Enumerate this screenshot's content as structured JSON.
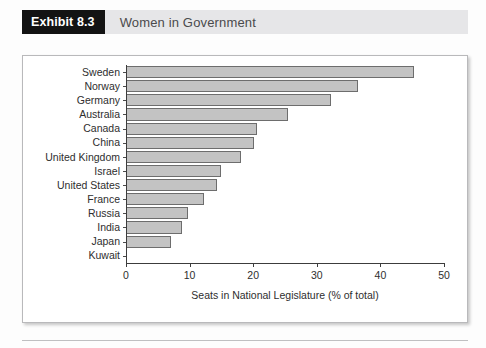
{
  "header": {
    "badge_label": "Exhibit 8.3",
    "title": "Women in Government",
    "badge_bg": "#131313",
    "band_bg": "#e6e6e8"
  },
  "chart_data": {
    "type": "bar",
    "orientation": "horizontal",
    "title": "Women in Government",
    "xlabel": "Seats in National Legislature (% of total)",
    "ylabel": "",
    "xlim": [
      0,
      50
    ],
    "xticks": [
      0,
      10,
      20,
      30,
      40,
      50
    ],
    "xtick_labels": [
      "0",
      "10",
      "20",
      "30",
      "40",
      "50"
    ],
    "grid": false,
    "legend": false,
    "bar_fill": "#c3c3c3",
    "bar_stroke": "#6d6d6d",
    "categories": [
      "Sweden",
      "Norway",
      "Germany",
      "Australia",
      "Canada",
      "China",
      "United Kingdom",
      "Israel",
      "United States",
      "France",
      "Russia",
      "India",
      "Japan",
      "Kuwait"
    ],
    "values": [
      45.3,
      36.4,
      32.2,
      25.4,
      20.6,
      20.2,
      18.1,
      15.0,
      14.3,
      12.2,
      9.8,
      8.8,
      7.1,
      0.0
    ]
  },
  "footer": {}
}
